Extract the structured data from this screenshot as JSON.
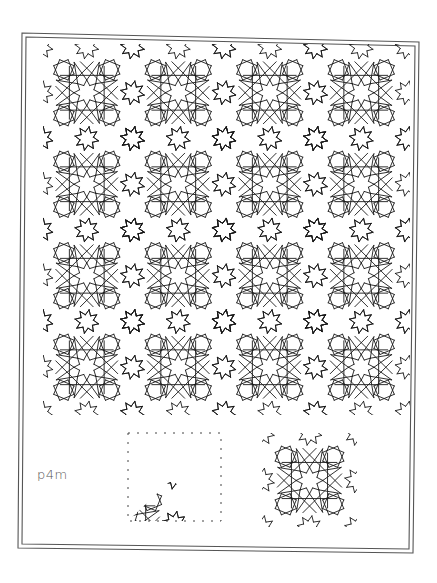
{
  "figure": {
    "symmetry_group_label": "p4m",
    "colors": {
      "background": "#ffffff",
      "frame_stroke": "#555555",
      "pattern_stroke": "#1a1a1a",
      "dash_stroke": "#444444",
      "label_color": "#555555"
    },
    "frame": {
      "outer": [
        [
          22,
          33
        ],
        [
          419,
          42
        ],
        [
          413,
          553
        ],
        [
          18,
          548
        ]
      ],
      "inner": [
        [
          26,
          37
        ],
        [
          415,
          46
        ],
        [
          409,
          549
        ],
        [
          22,
          544
        ]
      ]
    },
    "main_pattern": {
      "region": {
        "x": 43,
        "y": 44,
        "width": 367,
        "height": 371
      },
      "tile_size": 91.5,
      "rows": 4,
      "cols": 4,
      "origin": {
        "x": 41,
        "y": 47
      },
      "large_rosette": "8-fold rosette formed by two interlaced squares with extended arms",
      "small_star": "8-fold star at tile corners and edge midpoints"
    },
    "fundamental_domain_panel": {
      "dashed_box": {
        "x": 128,
        "y": 433,
        "width": 93,
        "height": 88
      },
      "description": "Triangular fundamental region of the p4m tiling shown in lower-left corner of a dashed square"
    },
    "unit_tile_panel": {
      "box": {
        "x": 262,
        "y": 433,
        "width": 95,
        "height": 94
      },
      "description": "Single repeating tile: central 8-fold rosette with surrounding interlaced squares"
    }
  }
}
